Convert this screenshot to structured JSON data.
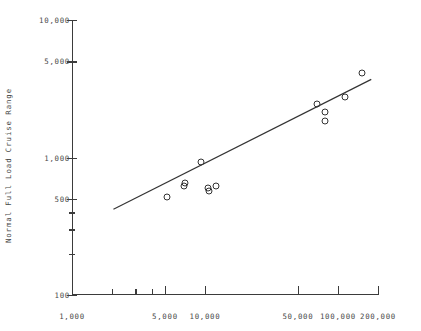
{
  "chart_data": {
    "type": "scatter",
    "title": "",
    "xlabel": "",
    "ylabel": "Normal Full Load Cruise Range",
    "xscale": "log",
    "yscale": "log",
    "xlim": [
      1000,
      200000
    ],
    "ylim": [
      100,
      10000
    ],
    "grid": false,
    "legend": null,
    "xticks": [
      {
        "value": 1000,
        "label": "1,000",
        "major": true
      },
      {
        "value": 2000,
        "label": "",
        "major": false
      },
      {
        "value": 3000,
        "label": "",
        "major": false
      },
      {
        "value": 4000,
        "label": "",
        "major": false
      },
      {
        "value": 5000,
        "label": "5,000",
        "major": true
      },
      {
        "value": 10000,
        "label": "10,000",
        "major": true
      },
      {
        "value": 50000,
        "label": "50,000",
        "major": true
      },
      {
        "value": 100000,
        "label": "100,000",
        "major": true
      },
      {
        "value": 200000,
        "label": "200,000",
        "major": true
      }
    ],
    "yticks": [
      {
        "value": 100,
        "label": "100",
        "major": true
      },
      {
        "value": 200,
        "label": "",
        "major": false
      },
      {
        "value": 300,
        "label": "",
        "major": false
      },
      {
        "value": 400,
        "label": "",
        "major": false
      },
      {
        "value": 500,
        "label": "500",
        "major": true
      },
      {
        "value": 1000,
        "label": "1,000",
        "major": true
      },
      {
        "value": 5000,
        "label": "5,000",
        "major": true
      },
      {
        "value": 10000,
        "label": "10,000",
        "major": true
      }
    ],
    "points": [
      {
        "x": 5200,
        "y": 520
      },
      {
        "x": 6900,
        "y": 620
      },
      {
        "x": 7100,
        "y": 650
      },
      {
        "x": 9400,
        "y": 930
      },
      {
        "x": 10600,
        "y": 600
      },
      {
        "x": 10700,
        "y": 570
      },
      {
        "x": 12000,
        "y": 620
      },
      {
        "x": 69000,
        "y": 2450
      },
      {
        "x": 80000,
        "y": 2150
      },
      {
        "x": 80500,
        "y": 1850
      },
      {
        "x": 113000,
        "y": 2750
      },
      {
        "x": 152000,
        "y": 4100
      }
    ],
    "trendline": {
      "type": "linear-on-log-log",
      "x_start": 2050,
      "y_start": 420,
      "x_end": 178000,
      "y_end": 3700
    },
    "colors": {
      "axis": "#3b3b3b",
      "text": "#4a4a4a",
      "marker": "#333333",
      "line": "#333333",
      "background": "#ffffff"
    }
  }
}
